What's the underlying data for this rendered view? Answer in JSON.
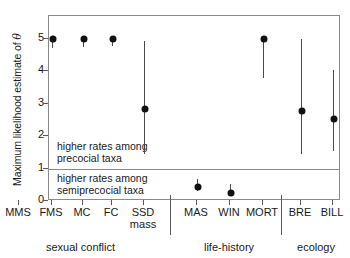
{
  "chart_data": {
    "type": "scatter",
    "title": "",
    "xlabel": "",
    "ylabel": "Maximum likelihood estimate of θ",
    "ylabel_prefix": "Maximum likelihood estimate of ",
    "ylabel_symbol": "θ",
    "ylim": [
      0,
      5.4
    ],
    "yticks": [
      5,
      4,
      3,
      2,
      1,
      0
    ],
    "ytick_labels": [
      "5",
      "4",
      "3",
      "2",
      "1",
      "0"
    ],
    "grid": false,
    "legend": "none",
    "threshold": 1,
    "categories": [
      "MMS",
      "FMS",
      "MC",
      "FC",
      "SSD mass",
      "MAS",
      "WIN",
      "MORT",
      "BRE",
      "BILL"
    ],
    "points": [
      {
        "label": "MMS",
        "label_line1": "MMS",
        "label_line2": "",
        "group": "sexual conflict",
        "value": 5.0,
        "ci_low": 3.33,
        "ci_high": 5.0
      },
      {
        "label": "FMS",
        "label_line1": "FMS",
        "label_line2": "",
        "group": "sexual conflict",
        "value": 5.0,
        "ci_low": 4.72,
        "ci_high": 5.0
      },
      {
        "label": "MC",
        "label_line1": "MC",
        "label_line2": "",
        "group": "sexual conflict",
        "value": 5.0,
        "ci_low": 4.76,
        "ci_high": 5.0
      },
      {
        "label": "FC",
        "label_line1": "FC",
        "label_line2": "",
        "group": "sexual conflict",
        "value": 5.0,
        "ci_low": 4.78,
        "ci_high": 5.0
      },
      {
        "label": "SSD mass",
        "label_line1": "SSD",
        "label_line2": "mass",
        "group": "sexual conflict",
        "value": 2.85,
        "ci_low": 1.45,
        "ci_high": 4.94
      },
      {
        "label": "MAS",
        "label_line1": "MAS",
        "label_line2": "",
        "group": "life-history",
        "value": 0.42,
        "ci_low": 0.32,
        "ci_high": 0.68
      },
      {
        "label": "WIN",
        "label_line1": "WIN",
        "label_line2": "",
        "group": "life-history",
        "value": 0.25,
        "ci_low": 0.18,
        "ci_high": 0.52
      },
      {
        "label": "MORT",
        "label_line1": "MORT",
        "label_line2": "",
        "group": "life-history",
        "value": 5.0,
        "ci_low": 3.79,
        "ci_high": 5.0
      },
      {
        "label": "BRE",
        "label_line1": "BRE",
        "label_line2": "",
        "group": "ecology",
        "value": 2.78,
        "ci_low": 1.45,
        "ci_high": 5.0
      },
      {
        "label": "BILL",
        "label_line1": "BILL",
        "label_line2": "",
        "group": "ecology",
        "value": 2.53,
        "ci_low": 1.54,
        "ci_high": 4.04
      }
    ],
    "groups": [
      {
        "label": "sexual conflict",
        "start": 0,
        "end": 4
      },
      {
        "label": "life-history",
        "start": 5,
        "end": 7
      },
      {
        "label": "ecology",
        "start": 8,
        "end": 9
      }
    ],
    "annotations": [
      {
        "id": "above",
        "line1": "higher rates among",
        "line2": "precocial taxa"
      },
      {
        "id": "below",
        "line1": "higher rates among",
        "line2": "semiprecocial taxa"
      }
    ]
  }
}
